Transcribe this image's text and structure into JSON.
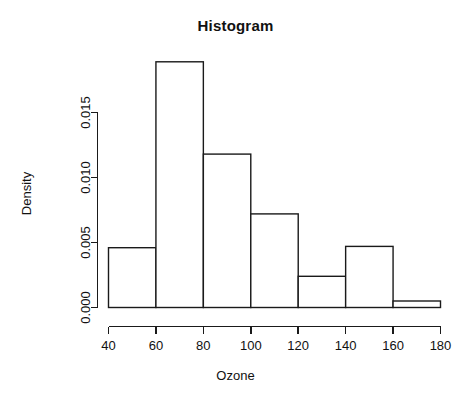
{
  "chart_data": {
    "type": "bar",
    "title": "Histogram",
    "xlabel": "Ozone",
    "ylabel": "Density",
    "grid": false,
    "legend": null,
    "xlim": [
      40,
      180
    ],
    "ylim": [
      0,
      0.0189
    ],
    "x_ticks": [
      40,
      60,
      80,
      100,
      120,
      140,
      160,
      180
    ],
    "x_tick_labels": [
      "40",
      "60",
      "80",
      "100",
      "120",
      "140",
      "160",
      "180"
    ],
    "y_ticks": [
      0.0,
      0.005,
      0.01,
      0.015
    ],
    "y_tick_labels": [
      "0.000",
      "0.005",
      "0.010",
      "0.015"
    ],
    "bin_edges": [
      40,
      60,
      80,
      100,
      120,
      140,
      160,
      180
    ],
    "categories": [
      "40-60",
      "60-80",
      "80-100",
      "100-120",
      "120-140",
      "140-160",
      "160-180"
    ],
    "values": [
      0.0046,
      0.0189,
      0.0118,
      0.0072,
      0.0024,
      0.0047,
      0.0005
    ]
  },
  "chart": {
    "title": "Histogram",
    "xlabel": "Ozone",
    "ylabel": "Density"
  }
}
